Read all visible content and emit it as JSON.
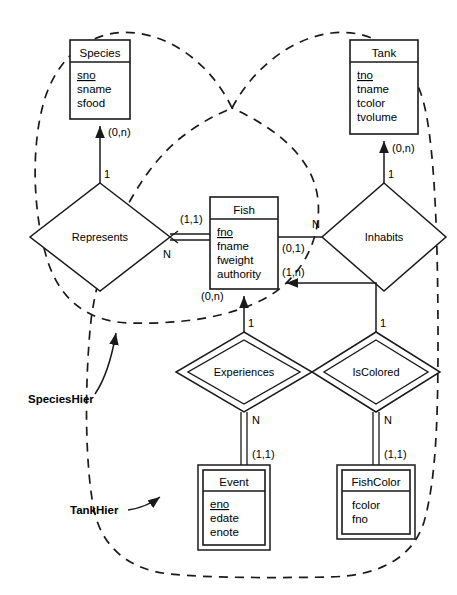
{
  "diagram": {
    "notation": "min-max + chen cardinality",
    "background_color": "#ffffff",
    "line_color": "#1a1a1a"
  },
  "entities": [
    {
      "id": "species",
      "name": "Species",
      "weak": false,
      "attributes": [
        {
          "label": "sno",
          "key": true
        },
        {
          "label": "sname",
          "key": false
        },
        {
          "label": "sfood",
          "key": false
        }
      ]
    },
    {
      "id": "tank",
      "name": "Tank",
      "weak": false,
      "attributes": [
        {
          "label": "tno",
          "key": true
        },
        {
          "label": "tname",
          "key": false
        },
        {
          "label": "tcolor",
          "key": false
        },
        {
          "label": "tvolume",
          "key": false
        }
      ]
    },
    {
      "id": "fish",
      "name": "Fish",
      "weak": false,
      "attributes": [
        {
          "label": "fno",
          "key": true
        },
        {
          "label": "fname",
          "key": false
        },
        {
          "label": "fweight",
          "key": false
        },
        {
          "label": "authority",
          "key": false
        }
      ]
    },
    {
      "id": "event",
      "name": "Event",
      "weak": true,
      "attributes": [
        {
          "label": "eno",
          "key": true
        },
        {
          "label": "edate",
          "key": false
        },
        {
          "label": "enote",
          "key": false
        }
      ]
    },
    {
      "id": "fishcolor",
      "name": "FishColor",
      "weak": true,
      "attributes": [
        {
          "label": "fcolor",
          "key": false
        },
        {
          "label": "fno",
          "key": false
        }
      ]
    }
  ],
  "relationships": [
    {
      "id": "represents",
      "name": "Represents",
      "identifying": false
    },
    {
      "id": "inhabits",
      "name": "Inhabits",
      "identifying": false
    },
    {
      "id": "experiences",
      "name": "Experiences",
      "identifying": true
    },
    {
      "id": "iscolored",
      "name": "IsColored",
      "identifying": true
    }
  ],
  "cardinalities": {
    "species_represents": "(0,n)",
    "represents_species_side": "1",
    "represents_fish_side": "N",
    "represents_fish_minmax": "(1,1)",
    "tank_inhabits": "(0,n)",
    "inhabits_tank_side": "1",
    "inhabits_fish_side": "N",
    "inhabits_fish_minmax": "(0,1)",
    "iscolored_fish_minmax": "(1,n)",
    "experiences_fish_minmax": "(0,n)",
    "experiences_fish_side": "1",
    "experiences_event_side": "N",
    "experiences_event_minmax": "(1,1)",
    "iscolored_fish_side": "1",
    "iscolored_fishcolor_side": "N",
    "iscolored_fishcolor_minmax": "(1,1)"
  },
  "annotations": [
    {
      "id": "specieshier",
      "label": "SpeciesHier"
    },
    {
      "id": "tankhier",
      "label": "TankHier"
    }
  ]
}
